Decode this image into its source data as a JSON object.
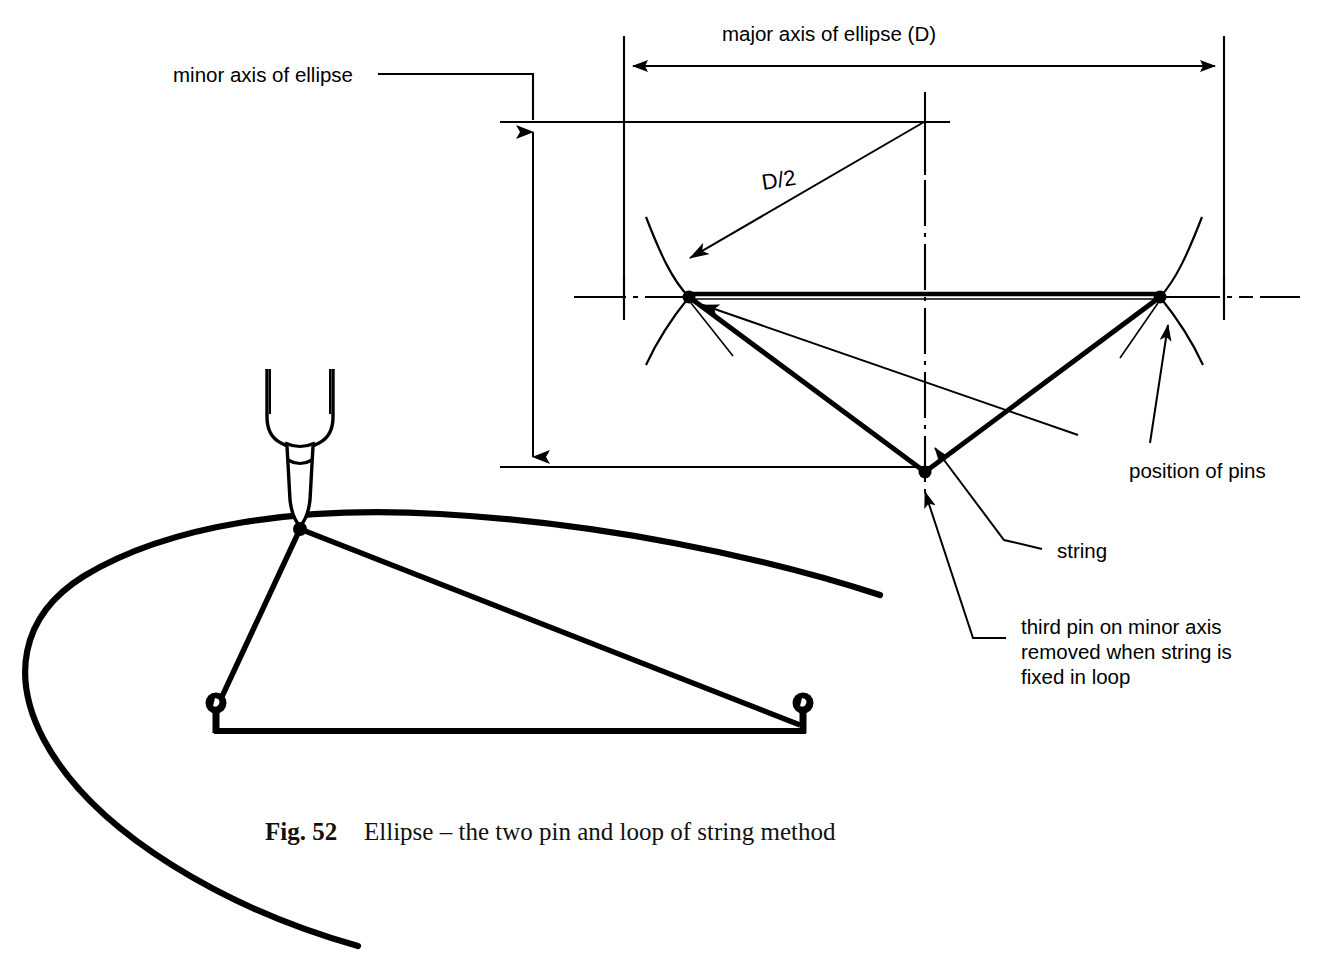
{
  "figure": {
    "number_label": "Fig. 52",
    "caption_text": "Ellipse – the two pin and loop of string method",
    "background_color": "#ffffff",
    "ink_color": "#000000"
  },
  "construction_diagram": {
    "labels": {
      "major_axis": "major axis of ellipse (D)",
      "minor_axis": "minor axis of ellipse",
      "radius": "D/2",
      "position_of_pins": "position of pins",
      "string": "string",
      "third_pin_line1": "third pin on minor axis",
      "third_pin_line2": "removed when string is",
      "third_pin_line3": "fixed in loop"
    },
    "dimensions": {
      "major_axis_arrow": {
        "x1": 626,
        "y1": 66,
        "x2": 1222,
        "y2": 66
      },
      "minor_axis_arrow": {
        "x1": 533,
        "y1": 122,
        "x2": 533,
        "y2": 467
      },
      "radius_arrow": {
        "x1": 925,
        "y1": 122,
        "x2": 683,
        "y2": 262
      },
      "left_focus": {
        "x": 689,
        "y": 297
      },
      "right_focus": {
        "x": 1160,
        "y": 297
      },
      "third_pin": {
        "x": 925,
        "y": 472
      },
      "centre": {
        "x": 925,
        "y": 297
      }
    }
  },
  "practical_diagram": {
    "pen": {
      "tip_x": 300,
      "tip_y": 528
    },
    "left_pin": {
      "x": 216,
      "y": 707
    },
    "right_pin": {
      "x": 803,
      "y": 707
    },
    "string_baseline": {
      "y": 731
    },
    "icons": {
      "pen": "pen-icon",
      "pin": "pin-icon"
    }
  }
}
